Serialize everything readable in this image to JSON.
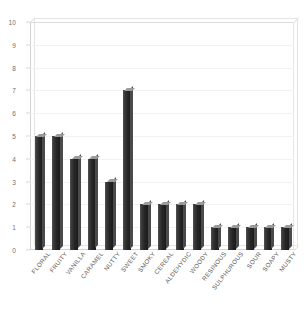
{
  "chart_data": {
    "type": "bar",
    "title": "",
    "xlabel": "",
    "ylabel": "",
    "ylim": [
      0,
      10
    ],
    "y_ticks": [
      0,
      1,
      2,
      3,
      4,
      5,
      6,
      7,
      8,
      9,
      10
    ],
    "grid": true,
    "legend": null,
    "style": "3d-bars",
    "bar_color": "#262626",
    "categories": [
      "FLORAL",
      "FRUITY",
      "VANILLA",
      "CARAMEL",
      "NUTTY",
      "SWEET",
      "SMOKY",
      "CEREAL",
      "ALDEHYDIC",
      "WOODY",
      "RESINOUS",
      "SULPHUROUS",
      "SOUR",
      "SOAPY",
      "MUSTY"
    ],
    "values": [
      5,
      5,
      4,
      4,
      3,
      7,
      2,
      2,
      2,
      2,
      1,
      1,
      1,
      1,
      1
    ]
  },
  "axis": {
    "tick_label_color": "#6e6e6e",
    "frame_color": "#d2d2d2"
  }
}
